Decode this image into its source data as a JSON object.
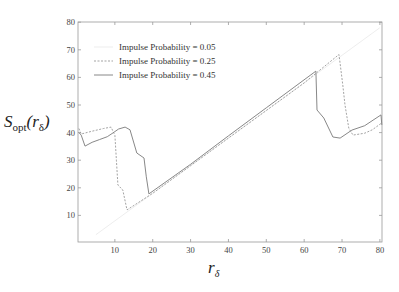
{
  "chart_data": {
    "type": "line",
    "title": "",
    "xlabel": "r_δ",
    "ylabel": "S_opt(r_δ)",
    "xlim": [
      0.3,
      80.5
    ],
    "ylim": [
      0.5,
      80
    ],
    "xticks": [
      10,
      20,
      30,
      40,
      50,
      60,
      70,
      80
    ],
    "yticks": [
      10,
      20,
      30,
      40,
      50,
      60,
      70,
      80
    ],
    "grid": false,
    "legend_position": "upper left",
    "series": [
      {
        "name": "Impulse Probability = 0.05",
        "style": "solid-faint",
        "color": "#e8e8e8",
        "x": [
          5,
          80
        ],
        "y": [
          3,
          78
        ]
      },
      {
        "name": "Impulse Probability = 0.25",
        "style": "dashed",
        "color": "#999999",
        "x": [
          0.5,
          1.1,
          4,
          7,
          9,
          10,
          10.4,
          10.8,
          12.1,
          13.2,
          20,
          30,
          40,
          50,
          60,
          69.2,
          70.2,
          70.8,
          71.8,
          72.9,
          76,
          78,
          80.8
        ],
        "y": [
          41.5,
          39.5,
          40.5,
          41.5,
          42,
          39,
          30,
          21,
          19.2,
          12,
          18,
          28,
          38,
          48,
          58,
          68.3,
          57.2,
          50,
          41.6,
          39.1,
          39.8,
          41,
          43.5
        ]
      },
      {
        "name": "Impulse Probability = 0.45",
        "style": "solid",
        "color": "#888888",
        "x": [
          0.5,
          1.1,
          2.1,
          4,
          6,
          8,
          9.5,
          11,
          12.7,
          14,
          15.8,
          17.7,
          18.3,
          19,
          30,
          40,
          50,
          63.1,
          63.4,
          65.2,
          67.6,
          69.5,
          72.6,
          76,
          80.3,
          81
        ],
        "y": [
          40,
          39.1,
          35.1,
          36.5,
          37.5,
          38.5,
          39.9,
          41.3,
          42,
          41,
          32.6,
          30.8,
          24,
          17.8,
          28.5,
          38.8,
          49,
          62.3,
          48.2,
          45.3,
          38.4,
          38,
          40.9,
          42.5,
          46.4,
          42.8
        ]
      }
    ]
  },
  "axes": {
    "xlabel_main": "r",
    "xlabel_sub": "δ",
    "ylabel_main": "S",
    "ylabel_sub": "opt",
    "ylabel_arg_open": "(",
    "ylabel_arg": "r",
    "ylabel_arg_sub": "δ",
    "ylabel_arg_close": ")"
  }
}
